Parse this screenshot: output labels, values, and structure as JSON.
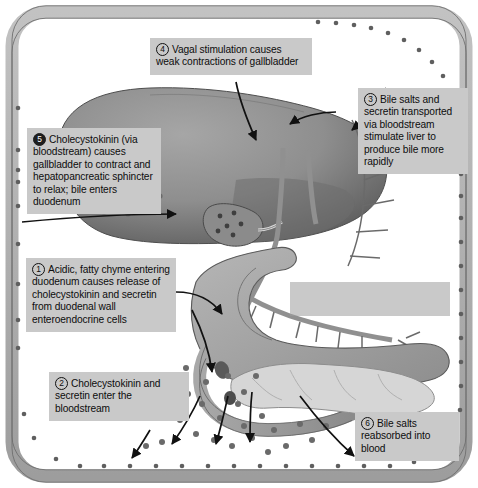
{
  "figure": {
    "frame_label": "bloodstream vessel band",
    "colors": {
      "callout_bg": "#c9c9c9",
      "vessel_band": "#b3b3b3",
      "vessel_outline": "#6d6d6d",
      "liver": "#8f8f8f",
      "liver_dark": "#5d5d5d",
      "stomach": "#9b9b9b",
      "duodenum": "#9a9a9a",
      "pancreas": "#d2d2d2",
      "vessel_red": "#8a8a8a",
      "particle": "#6a6a6a",
      "arrow": "#111111",
      "text": "#0d0d0d"
    }
  },
  "callouts": [
    {
      "id": "callout-1",
      "number": "1",
      "number_style": "outline",
      "text": "Acidic, fatty chyme entering duodenum causes release of cholecystokinin and secretin from duodenal wall enteroendocrine cells"
    },
    {
      "id": "callout-2",
      "number": "2",
      "number_style": "outline",
      "text": "Cholecystokinin and secretin enter the bloodstream"
    },
    {
      "id": "callout-3",
      "number": "3",
      "number_style": "outline",
      "text": "Bile salts and secretin transported via bloodstream stimulate liver to produce bile more rapidly"
    },
    {
      "id": "callout-4",
      "number": "4",
      "number_style": "outline",
      "text": "Vagal stimulation causes weak contractions of gallbladder"
    },
    {
      "id": "callout-5",
      "number": "5",
      "number_style": "filled",
      "text": "Cholecystokinin (via bloodstream) causes gallbladder to contract and hepatopancreatic sphincter to relax; bile enters duodenum"
    },
    {
      "id": "callout-6",
      "number": "6",
      "number_style": "outline",
      "text": "Bile salts reabsorbed into blood"
    }
  ],
  "anatomy": [
    {
      "name": "liver",
      "label": "Liver"
    },
    {
      "name": "gallbladder",
      "label": "Gallbladder"
    },
    {
      "name": "cystic-duct",
      "label": "Cystic duct"
    },
    {
      "name": "common-bile-duct",
      "label": "Common bile duct"
    },
    {
      "name": "stomach",
      "label": "Stomach"
    },
    {
      "name": "duodenum",
      "label": "Duodenum"
    },
    {
      "name": "pancreas",
      "label": "Pancreas"
    },
    {
      "name": "hepatopancreatic-sphincter",
      "label": "Hepatopancreatic sphincter"
    },
    {
      "name": "bloodstream-vessel",
      "label": "Bloodstream"
    },
    {
      "name": "bile-salt-particles",
      "label": "Bile salts / hormones in blood"
    }
  ]
}
